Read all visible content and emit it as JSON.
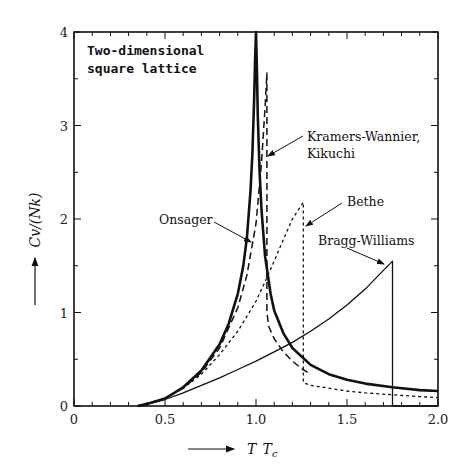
{
  "chart_data": {
    "type": "line",
    "title": "Two-dimensional square lattice",
    "title_lines": [
      "Two-dimensional",
      "square lattice"
    ],
    "xlabel": "T/Tc",
    "xlabel_display": "T Tc",
    "ylabel": "Cv/(Nk)",
    "xlim": [
      0,
      2.0
    ],
    "ylim": [
      0,
      4
    ],
    "x_ticks": [
      0,
      0.5,
      1.0,
      1.5,
      2.0
    ],
    "x_tick_labels": [
      "0",
      "0.5",
      "1.0",
      "1.5",
      "2.0"
    ],
    "y_ticks": [
      0,
      1,
      2,
      3,
      4
    ],
    "y_tick_labels": [
      "0",
      "1",
      "2",
      "3",
      "4"
    ],
    "grid": false,
    "legend": "inline annotations with arrows",
    "series": [
      {
        "name": "Onsager",
        "style": "solid-thick",
        "x": [
          0.35,
          0.4,
          0.5,
          0.6,
          0.7,
          0.8,
          0.85,
          0.9,
          0.93,
          0.95,
          0.97,
          0.98,
          0.99,
          0.995,
          1.0,
          1.005,
          1.01,
          1.02,
          1.03,
          1.05,
          1.08,
          1.1,
          1.15,
          1.2,
          1.3,
          1.4,
          1.5,
          1.6,
          1.75,
          1.9,
          2.0
        ],
        "values": [
          0.0,
          0.02,
          0.08,
          0.2,
          0.38,
          0.66,
          0.88,
          1.2,
          1.5,
          1.8,
          2.3,
          2.7,
          3.3,
          3.7,
          4.0,
          3.6,
          3.1,
          2.5,
          2.1,
          1.6,
          1.2,
          1.02,
          0.78,
          0.62,
          0.44,
          0.34,
          0.28,
          0.24,
          0.2,
          0.17,
          0.16
        ]
      },
      {
        "name": "Kramers-Wannier, Kikuchi",
        "style": "dashed-long",
        "x": [
          0.35,
          0.4,
          0.5,
          0.6,
          0.7,
          0.8,
          0.9,
          0.95,
          1.0,
          1.03,
          1.05,
          1.06,
          1.06,
          1.07,
          1.1,
          1.15,
          1.2,
          1.25,
          1.3
        ],
        "values": [
          0.0,
          0.02,
          0.08,
          0.19,
          0.36,
          0.62,
          1.05,
          1.4,
          1.95,
          2.6,
          3.2,
          3.56,
          1.0,
          0.85,
          0.72,
          0.58,
          0.48,
          0.4,
          0.34
        ]
      },
      {
        "name": "Bethe",
        "style": "dashed-short",
        "x": [
          0.35,
          0.4,
          0.5,
          0.6,
          0.7,
          0.8,
          0.9,
          1.0,
          1.05,
          1.1,
          1.15,
          1.2,
          1.25,
          1.26,
          1.26,
          1.3,
          1.4,
          1.5,
          1.6,
          1.75,
          1.9,
          2.0
        ],
        "values": [
          0.0,
          0.02,
          0.08,
          0.19,
          0.34,
          0.55,
          0.8,
          1.12,
          1.33,
          1.55,
          1.78,
          2.0,
          2.15,
          2.18,
          0.25,
          0.22,
          0.19,
          0.16,
          0.14,
          0.12,
          0.1,
          0.09
        ]
      },
      {
        "name": "Bragg-Williams",
        "style": "solid-thin",
        "x": [
          0.35,
          0.4,
          0.5,
          0.6,
          0.7,
          0.8,
          0.9,
          1.0,
          1.1,
          1.2,
          1.3,
          1.4,
          1.5,
          1.6,
          1.7,
          1.75,
          1.75,
          2.0
        ],
        "values": [
          0.0,
          0.02,
          0.07,
          0.14,
          0.22,
          0.3,
          0.39,
          0.48,
          0.58,
          0.68,
          0.8,
          0.93,
          1.08,
          1.25,
          1.45,
          1.55,
          0.0,
          0.0
        ]
      }
    ],
    "annotations": [
      {
        "text": "Onsager",
        "x": 0.78,
        "y": 1.95,
        "arrow_to": [
          0.985,
          1.7
        ]
      },
      {
        "text": "Kramers-Wannier,",
        "x": 1.2,
        "y": 2.9,
        "arrow_to": [
          1.05,
          2.55
        ]
      },
      {
        "text": "Kikuchi",
        "x": 1.2,
        "y": 2.68,
        "arrow_to": null
      },
      {
        "text": "Bethe",
        "x": 1.4,
        "y": 2.25,
        "arrow_to": [
          1.27,
          1.85
        ]
      },
      {
        "text": "Bragg-Williams",
        "x": 1.45,
        "y": 1.78,
        "arrow_to": [
          1.72,
          1.52
        ]
      }
    ]
  },
  "chart": {
    "title_line1": "Two-dimensional",
    "title_line2": "square lattice",
    "ylabel": "Cv/(Nk)",
    "xlabel_T": "T",
    "xlabel_Tc": "T",
    "xlabel_sub": "c",
    "labels": {
      "onsager": "Onsager",
      "kw1": "Kramers-Wannier,",
      "kw2": "Kikuchi",
      "bethe": "Bethe",
      "bw": "Bragg-Williams"
    }
  }
}
